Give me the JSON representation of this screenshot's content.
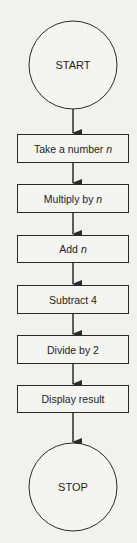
{
  "flowchart": {
    "colors": {
      "background": "#f1f1ee",
      "stroke": "#2a2a2a",
      "box_fill": "#f4f4f1",
      "text": "#1e1e1e"
    },
    "start": {
      "label": "START"
    },
    "steps": [
      {
        "label": "Take a number ",
        "var": "n"
      },
      {
        "label": "Multiply by ",
        "var": "n"
      },
      {
        "label": "Add ",
        "var": "n"
      },
      {
        "label": "Subtract 4",
        "var": ""
      },
      {
        "label": "Divide by 2",
        "var": ""
      },
      {
        "label": "Display result",
        "var": ""
      }
    ],
    "stop": {
      "label": "STOP"
    }
  }
}
